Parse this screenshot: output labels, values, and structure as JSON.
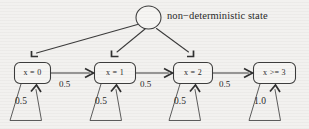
{
  "figure": {
    "kind": "state-transition-diagram",
    "background_color": "#f2f1ef",
    "ink_color": "#3a3a3a",
    "caption_label": "non−deterministic state"
  },
  "nondeterministic_node": {
    "shape": "circle",
    "label": "non−deterministic state"
  },
  "states": [
    {
      "id": "s0",
      "label": "x = 0"
    },
    {
      "id": "s1",
      "label": "x = 1"
    },
    {
      "id": "s2",
      "label": "x = 2"
    },
    {
      "id": "s3",
      "label": "x >= 3"
    }
  ],
  "transitions": [
    {
      "from": "s0",
      "to": "s1",
      "label": "0.5"
    },
    {
      "from": "s1",
      "to": "s2",
      "label": "0.5"
    },
    {
      "from": "s2",
      "to": "s3",
      "label": "0.5"
    }
  ],
  "self_loops": [
    {
      "state": "s0",
      "label": "0.5"
    },
    {
      "state": "s1",
      "label": "0.5"
    },
    {
      "state": "s2",
      "label": "0.5"
    },
    {
      "state": "s3",
      "label": "1.0"
    }
  ],
  "nondeterministic_edges": [
    {
      "to": "s0"
    },
    {
      "to": "s1"
    },
    {
      "to": "s2"
    }
  ]
}
